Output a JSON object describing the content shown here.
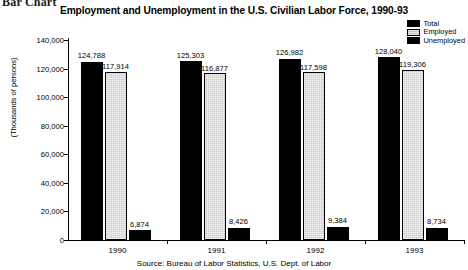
{
  "document": {
    "caption": "Bar Chart"
  },
  "legend": {
    "position": "top-right",
    "entries": [
      {
        "label": "Total",
        "swatch": "solid",
        "color": "#000000"
      },
      {
        "label": "Employed",
        "swatch": "hatched",
        "color": "#c9c9c9"
      },
      {
        "label": "Unemployed",
        "swatch": "solid",
        "color": "#000000"
      }
    ]
  },
  "source": {
    "text": "Source: Bureau of Labor Statistics, U.S. Dept. of Labor"
  },
  "chart_data": {
    "type": "bar",
    "title": "Employment and Unemployment in the U.S. Civilian Labor Force, 1990-93",
    "xlabel": "",
    "ylabel": "(Thousands of persons)",
    "ylim": [
      0,
      140000
    ],
    "ytick_labels": [
      "0",
      "20,000",
      "40,000",
      "60,000",
      "80,000",
      "100,000",
      "120,000",
      "140,000"
    ],
    "ytick_values": [
      0,
      20000,
      40000,
      60000,
      80000,
      100000,
      120000,
      140000
    ],
    "grid": false,
    "categories": [
      "1990",
      "1991",
      "1992",
      "1993"
    ],
    "series": [
      {
        "name": "Total",
        "color": "#000000",
        "values": [
          124788,
          125303,
          126982,
          128040
        ],
        "labels": [
          "124,788",
          "125,303",
          "126,982",
          "128,040"
        ]
      },
      {
        "name": "Employed",
        "color": "#c9c9c9",
        "values": [
          117914,
          116877,
          117598,
          119306
        ],
        "labels": [
          "117,914",
          "116,877",
          "117,598",
          "119,306"
        ]
      },
      {
        "name": "Unemployed",
        "color": "#000000",
        "values": [
          6874,
          8426,
          9384,
          8734
        ],
        "labels": [
          "6,874",
          "8,426",
          "9,384",
          "8,734"
        ]
      }
    ]
  }
}
